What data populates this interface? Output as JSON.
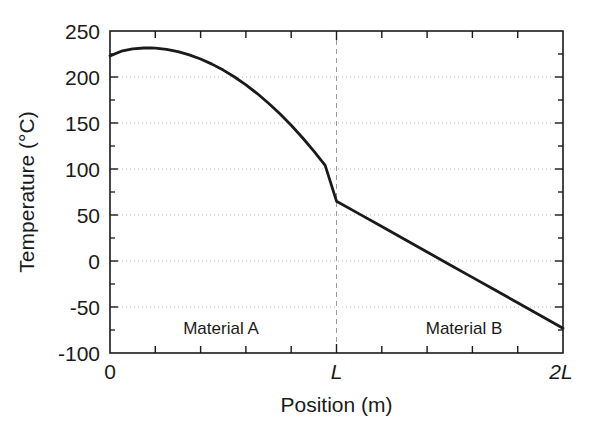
{
  "chart_data": {
    "type": "line",
    "title": "",
    "xlabel": "Position (m)",
    "ylabel": "Temperature (°C)",
    "xlim": [
      0,
      2
    ],
    "ylim": [
      -100,
      250
    ],
    "x_tick_labels": [
      "0",
      "L",
      "2L"
    ],
    "x_tick_values": [
      0,
      1,
      2
    ],
    "x_minor_tick_step": 0.2,
    "y_tick_labels": [
      "250",
      "200",
      "150",
      "100",
      "50",
      "0",
      "-50",
      "-100"
    ],
    "y_tick_values": [
      250,
      200,
      150,
      100,
      50,
      0,
      -50,
      -100
    ],
    "y_minor_tick_step": 25,
    "grid": "horizontal-dotted",
    "legend": "none",
    "line_color": "#1a1a1a",
    "grid_color": "#b4b4b4",
    "axis_color": "#1a1a1a",
    "interface_marker": {
      "label": "L",
      "x": 1,
      "style": "dashed-vertical",
      "color": "#9a9a9a"
    },
    "annotations": [
      {
        "text": "Material A",
        "x": 0.47,
        "y": -62
      },
      {
        "text": "Material B",
        "x": 1.53,
        "y": -62
      }
    ],
    "series": [
      {
        "name": "Temperature profile",
        "x": [
          0.0,
          0.05,
          0.1,
          0.15,
          0.18,
          0.2,
          0.25,
          0.3,
          0.35,
          0.4,
          0.45,
          0.5,
          0.55,
          0.6,
          0.65,
          0.7,
          0.75,
          0.8,
          0.85,
          0.9,
          0.95,
          1.0,
          1.1,
          1.2,
          1.3,
          1.4,
          1.5,
          1.6,
          1.7,
          1.8,
          1.9,
          2.0
        ],
        "y": [
          223,
          228,
          230.5,
          231.5,
          231.6,
          231.4,
          230,
          227.5,
          224,
          219.5,
          214,
          207.5,
          200,
          191.5,
          182,
          171.5,
          160,
          147.5,
          134,
          119.5,
          104,
          65,
          51.2,
          37.4,
          23.6,
          9.8,
          -4,
          -17.8,
          -31.6,
          -45.4,
          -59.2,
          -73
        ]
      }
    ]
  },
  "axes": {
    "y_title": "Temperature (°C)",
    "x_title": "Position (m)"
  },
  "labels": {
    "material_a": "Material A",
    "material_b": "Material B",
    "y_ticks": {
      "t250": "250",
      "t200": "200",
      "t150": "150",
      "t100": "100",
      "t50": "50",
      "t0": "0",
      "tm50": "-50",
      "tm100": "-100"
    },
    "x_ticks": {
      "x0": "0",
      "xL": "L",
      "x2L": "2L"
    }
  }
}
